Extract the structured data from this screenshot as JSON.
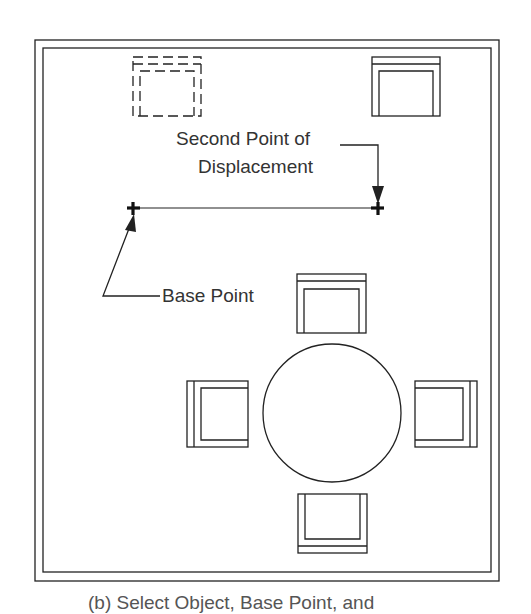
{
  "diagram": {
    "type": "cad-move-command-illustration",
    "labels": {
      "second_point_line1": "Second Point of",
      "second_point_line2": "Displacement",
      "base_point": "Base Point",
      "caption_partial": "(b) Select Object, Base Point, and"
    },
    "colors": {
      "line": "#222222",
      "text": "#333333",
      "background": "#ffffff"
    },
    "points": {
      "base_point": {
        "x": 133,
        "y": 208
      },
      "second_point": {
        "x": 378,
        "y": 208
      }
    },
    "objects": [
      {
        "name": "chair-original-dashed",
        "style": "dashed"
      },
      {
        "name": "chair-moved",
        "style": "solid"
      },
      {
        "name": "table-round",
        "style": "solid"
      },
      {
        "name": "chair-top",
        "style": "solid"
      },
      {
        "name": "chair-left",
        "style": "solid"
      },
      {
        "name": "chair-right",
        "style": "solid"
      },
      {
        "name": "chair-bottom",
        "style": "solid"
      }
    ]
  }
}
